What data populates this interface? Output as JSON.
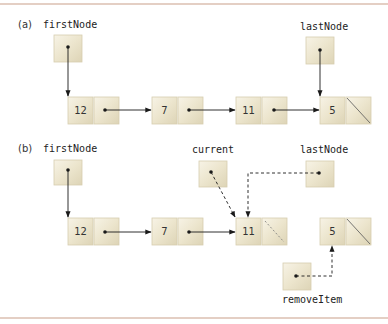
{
  "figure": {
    "rule_color": "#c9a08a",
    "box_fill": "#ece6d0",
    "box_highlight": "#f6f2e4",
    "box_shadow": "#cfc6a8",
    "arrow_color": "#1a1a1a"
  },
  "part_a": {
    "label": "(a)",
    "first_node_label": "firstNode",
    "last_node_label": "lastNode",
    "nodes": [
      {
        "value": "12",
        "next": "pointer"
      },
      {
        "value": "7",
        "next": "pointer"
      },
      {
        "value": "11",
        "next": "pointer"
      },
      {
        "value": "5",
        "next": "null"
      }
    ]
  },
  "part_b": {
    "label": "(b)",
    "first_node_label": "firstNode",
    "current_label": "current",
    "last_node_label": "lastNode",
    "remove_item_label": "removeItem",
    "nodes": [
      {
        "value": "12",
        "next": "pointer"
      },
      {
        "value": "7",
        "next": "pointer"
      },
      {
        "value": "11",
        "next": "null (dashed)"
      },
      {
        "value": "5",
        "next": "null"
      }
    ]
  }
}
